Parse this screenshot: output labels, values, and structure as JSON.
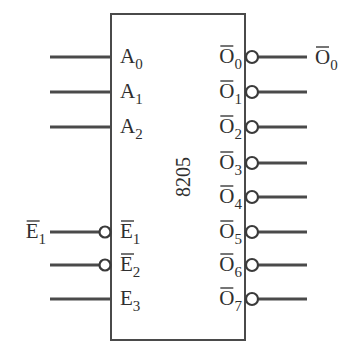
{
  "diagram": {
    "chip": {
      "name": "8205",
      "box": {
        "x": 111,
        "y": 14,
        "w": 134,
        "h": 326
      },
      "color": "#4a4a4a"
    },
    "inputs": [
      {
        "id": "A0",
        "base": "A",
        "sub": "0",
        "overbar": false,
        "bubble": false,
        "y": 57
      },
      {
        "id": "A1",
        "base": "A",
        "sub": "1",
        "overbar": false,
        "bubble": false,
        "y": 92
      },
      {
        "id": "A2",
        "base": "A",
        "sub": "2",
        "overbar": false,
        "bubble": false,
        "y": 127
      },
      {
        "id": "E1",
        "base": "E",
        "sub": "1",
        "overbar": true,
        "bubble": true,
        "y": 232,
        "external_label": {
          "base": "E",
          "sub": "1",
          "overbar": true
        }
      },
      {
        "id": "E2",
        "base": "E",
        "sub": "2",
        "overbar": true,
        "bubble": true,
        "y": 265
      },
      {
        "id": "E3",
        "base": "E",
        "sub": "3",
        "overbar": false,
        "bubble": false,
        "y": 299
      }
    ],
    "outputs": [
      {
        "id": "O0",
        "base": "O",
        "sub": "0",
        "overbar": true,
        "bubble": true,
        "y": 57,
        "external_label": {
          "base": "O",
          "sub": "0",
          "overbar": true
        }
      },
      {
        "id": "O1",
        "base": "O",
        "sub": "1",
        "overbar": true,
        "bubble": true,
        "y": 92
      },
      {
        "id": "O2",
        "base": "O",
        "sub": "2",
        "overbar": true,
        "bubble": true,
        "y": 127
      },
      {
        "id": "O3",
        "base": "O",
        "sub": "3",
        "overbar": true,
        "bubble": true,
        "y": 163
      },
      {
        "id": "O4",
        "base": "O",
        "sub": "4",
        "overbar": true,
        "bubble": true,
        "y": 197
      },
      {
        "id": "O5",
        "base": "O",
        "sub": "5",
        "overbar": true,
        "bubble": true,
        "y": 232
      },
      {
        "id": "O6",
        "base": "O",
        "sub": "6",
        "overbar": true,
        "bubble": true,
        "y": 265
      },
      {
        "id": "O7",
        "base": "O",
        "sub": "7",
        "overbar": true,
        "bubble": true,
        "y": 299
      }
    ]
  }
}
